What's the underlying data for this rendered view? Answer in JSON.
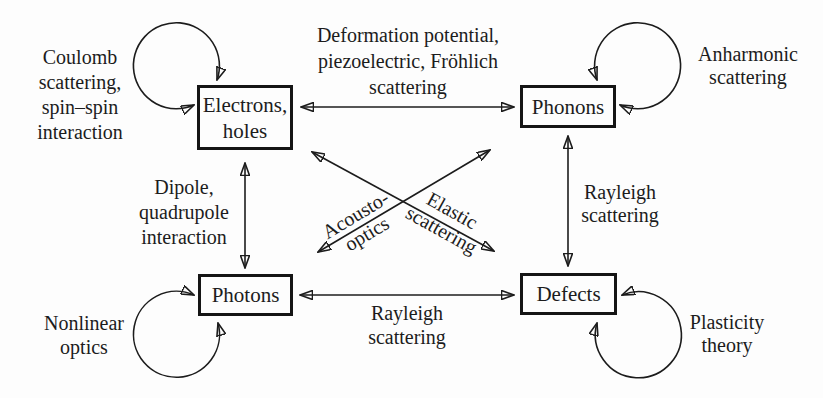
{
  "diagram_title": "",
  "nodes": {
    "electrons": {
      "line1": "Electrons,",
      "line2": "holes"
    },
    "phonons": {
      "label": "Phonons"
    },
    "photons": {
      "label": "Photons"
    },
    "defects": {
      "label": "Defects"
    }
  },
  "edge_labels": {
    "electrons_phonons": {
      "line1": "Deformation potential,",
      "line2": "piezoelectric, Fröhlich",
      "line3": "scattering"
    },
    "electrons_photons": {
      "line1": "Dipole,",
      "line2": "quadrupole",
      "line3": "interaction"
    },
    "phonons_defects": {
      "line1": "Rayleigh",
      "line2": "scattering"
    },
    "photons_defects": {
      "line1": "Rayleigh",
      "line2": "scattering"
    },
    "phonons_photons": {
      "line1": "Acousto-",
      "line2": "optics"
    },
    "electrons_defects": {
      "line1": "Elastic",
      "line2": "scattering"
    }
  },
  "self_loop_labels": {
    "electrons": {
      "line1": "Coulomb",
      "line2": "scattering,",
      "line3": "spin–spin",
      "line4": "interaction"
    },
    "phonons": {
      "line1": "Anharmonic",
      "line2": "scattering"
    },
    "photons": {
      "line1": "Nonlinear",
      "line2": "optics"
    },
    "defects": {
      "line1": "Plasticity",
      "line2": "theory"
    }
  },
  "colors": {
    "ink": "#1c1c1c",
    "background": "#fdfdfd"
  }
}
